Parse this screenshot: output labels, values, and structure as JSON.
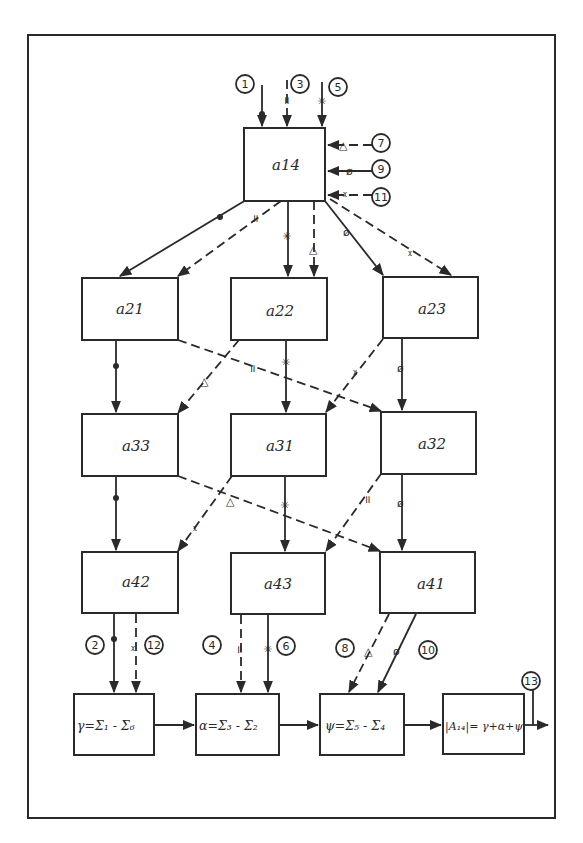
{
  "diagram": {
    "type": "hand-drawn block diagram (flow of signals between matrix-element blocks)",
    "colors": {
      "ink": "#2a2a2a",
      "paper": "#ffffff"
    },
    "blocks": {
      "a14": "a14",
      "a21": "a21",
      "a22": "a22",
      "a23": "a23",
      "a33": "a33",
      "a31": "a31",
      "a32": "a32",
      "a42": "a42",
      "a43": "a43",
      "a41": "a41"
    },
    "formulas": {
      "gamma": "γ=Σ₁ - Σ₆",
      "alpha": "α=Σ₃ - Σ₂",
      "psi": "ψ=Σ₅ - Σ₄",
      "result": "|A₁₄|= γ+α+ψ"
    },
    "ports": {
      "p1": "1",
      "p2": "2",
      "p3": "3",
      "p4": "4",
      "p5": "5",
      "p6": "6",
      "p7": "7",
      "p8": "8",
      "p9": "9",
      "p10": "10",
      "p11": "11",
      "p12": "12",
      "p13": "13"
    },
    "markers": {
      "dot": "●",
      "double_bar": "॥",
      "asterisk": "✳",
      "triangle": "△",
      "slashed_circle": "ø",
      "cross": "ᵡ"
    },
    "signals": [
      {
        "port": "1",
        "marker": "dot",
        "style": "solid",
        "path": [
          "a14",
          "a21",
          "a33",
          "a42",
          "gamma"
        ]
      },
      {
        "port": "3",
        "marker": "double_bar",
        "style": "dashed",
        "path": [
          "a14",
          "a21",
          "a32",
          "a43",
          "alpha"
        ]
      },
      {
        "port": "5",
        "marker": "asterisk",
        "style": "solid",
        "path": [
          "a14",
          "a22",
          "a31",
          "a43",
          "alpha"
        ]
      },
      {
        "port": "7",
        "marker": "triangle",
        "style": "dashed",
        "path": [
          "a14",
          "a22",
          "a33",
          "a41",
          "psi"
        ]
      },
      {
        "port": "9",
        "marker": "slashed_circle",
        "style": "solid",
        "path": [
          "a14",
          "a23",
          "a32",
          "a41",
          "psi"
        ]
      },
      {
        "port": "11",
        "marker": "cross",
        "style": "dashed",
        "path": [
          "a14",
          "a23",
          "a31",
          "a42",
          "gamma"
        ]
      }
    ],
    "output_port": "13"
  }
}
